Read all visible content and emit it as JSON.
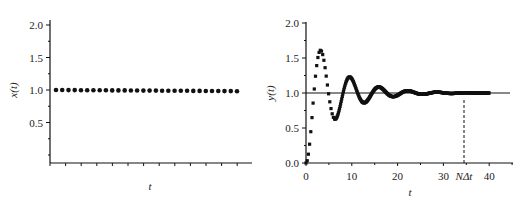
{
  "chart_data": [
    {
      "type": "scatter",
      "panel": "left",
      "title": "",
      "xlabel": "t",
      "ylabel": "x(t)",
      "ylim": [
        0,
        2.0
      ],
      "yticks": [
        "2.0",
        "1.5",
        "1.0",
        "0.5"
      ],
      "xticks": [],
      "grid": false,
      "legend": null,
      "series": [
        {
          "name": "x(t)",
          "marker": "circle",
          "constant_value": 1.0,
          "num_points": 30
        }
      ]
    },
    {
      "type": "scatter",
      "panel": "right",
      "title": "",
      "xlabel": "t",
      "ylabel": "y(t)",
      "xlim": [
        0,
        45
      ],
      "ylim": [
        0,
        2.0
      ],
      "xticks": [
        "0",
        "10",
        "20",
        "30",
        "40"
      ],
      "yticks": [
        "0.0",
        "0.5",
        "1.0",
        "1.5",
        "2.0"
      ],
      "grid": false,
      "legend": null,
      "reference_line": {
        "y": 1.0
      },
      "annotation": {
        "label": "NΔt",
        "x": 34.5,
        "style": "dashed vertical line"
      },
      "series": [
        {
          "name": "y(t)",
          "marker": "square",
          "description": "damped oscillatory step response",
          "t_end": 40,
          "extrema": [
            {
              "t": 3.2,
              "y": 1.62
            },
            {
              "t": 6.3,
              "y": 0.62
            },
            {
              "t": 9.5,
              "y": 1.24
            },
            {
              "t": 12.7,
              "y": 0.86
            },
            {
              "t": 16.0,
              "y": 1.09
            },
            {
              "t": 19.0,
              "y": 0.95
            },
            {
              "t": 22.3,
              "y": 1.03
            },
            {
              "t": 25.5,
              "y": 0.98
            },
            {
              "t": 28.7,
              "y": 1.01
            }
          ]
        }
      ]
    }
  ],
  "left": {
    "ylabel": "x(t)",
    "xlabel": "t",
    "yticks": [
      {
        "label": "2.0",
        "value": 2.0
      },
      {
        "label": "1.5",
        "value": 1.5
      },
      {
        "label": "1.0",
        "value": 1.0
      },
      {
        "label": "0.5",
        "value": 0.5
      }
    ]
  },
  "right": {
    "ylabel": "y(t)",
    "xlabel": "t",
    "annotation_label": "NΔt",
    "yticks": [
      {
        "label": "2.0",
        "value": 2.0
      },
      {
        "label": "1.5",
        "value": 1.5
      },
      {
        "label": "1.0",
        "value": 1.0
      },
      {
        "label": "0.5",
        "value": 0.5
      },
      {
        "label": "0.0",
        "value": 0.0
      }
    ],
    "xticks": [
      {
        "label": "0",
        "value": 0
      },
      {
        "label": "10",
        "value": 10
      },
      {
        "label": "20",
        "value": 20
      },
      {
        "label": "30",
        "value": 30
      },
      {
        "label": "40",
        "value": 40
      }
    ]
  }
}
